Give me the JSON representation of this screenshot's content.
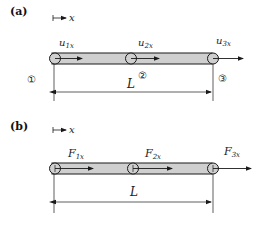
{
  "colors": {
    "bar_fill": "#cfcfcf",
    "stroke": "#1a1a1a",
    "background": "#ffffff"
  },
  "panels": [
    {
      "label": "(a)",
      "axis": {
        "symbol": "x"
      },
      "nodes": [
        {
          "number": "①",
          "var_main": "u",
          "var_sub": "1x"
        },
        {
          "number": "②",
          "var_main": "u",
          "var_sub": "2x"
        },
        {
          "number": "③",
          "var_main": "u",
          "var_sub": "3x"
        }
      ],
      "dimension": "L"
    },
    {
      "label": "(b)",
      "axis": {
        "symbol": "x"
      },
      "nodes": [
        {
          "var_main": "F",
          "var_sub": "1x"
        },
        {
          "var_main": "F",
          "var_sub": "2x"
        },
        {
          "var_main": "F",
          "var_sub": "3x"
        }
      ],
      "dimension": "L"
    }
  ]
}
